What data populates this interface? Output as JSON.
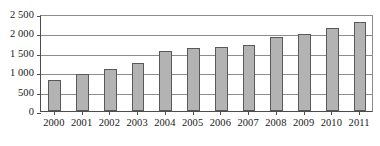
{
  "chart_data": {
    "type": "bar",
    "title": "",
    "subtitle": "",
    "xlabel": "",
    "ylabel": "",
    "categories": [
      "2000",
      "2001",
      "2002",
      "2003",
      "2004",
      "2005",
      "2006",
      "2007",
      "2008",
      "2009",
      "2010",
      "2011"
    ],
    "values": [
      800,
      950,
      1070,
      1250,
      1540,
      1620,
      1660,
      1700,
      1920,
      1980,
      2150,
      2300
    ],
    "series": [
      {
        "name": "",
        "values": [
          800,
          950,
          1070,
          1250,
          1540,
          1620,
          1660,
          1700,
          1920,
          1980,
          2150,
          2300
        ]
      }
    ],
    "ylim": [
      0,
      2500
    ],
    "yticks": [
      0,
      500,
      1000,
      1500,
      2000,
      2500
    ],
    "ytick_labels": [
      "0",
      "500",
      "1 000",
      "1 500",
      "2 000",
      "2 500"
    ],
    "xtick_labels": [
      "2000",
      "2001",
      "2002",
      "2003",
      "2004",
      "2005",
      "2006",
      "2007",
      "2008",
      "2009",
      "2010",
      "2011"
    ],
    "grid": true,
    "grid_axis": "y",
    "legend": false,
    "legend_position": "none",
    "annotations": [],
    "colors": {
      "bar_fill": "#b3b3b3",
      "bar_stroke": "#595959",
      "gridline": "#8c8c8c",
      "axis": "#4d4d4d",
      "text": "#1a1a1a",
      "background": "#ffffff"
    }
  }
}
